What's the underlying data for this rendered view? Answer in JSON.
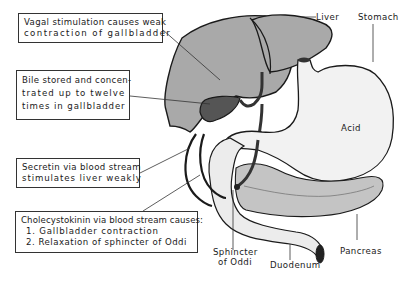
{
  "diagram": {
    "callouts": {
      "vagal": {
        "lines": [
          "Vagal stimulation causes weak",
          "contraction of gallbladder"
        ]
      },
      "bile": {
        "lines": [
          "Bile stored and concen-",
          "trated up to twelve",
          "times in gallbladder"
        ]
      },
      "secretin": {
        "lines": [
          "Secretin via blood stream",
          "stimulates liver weakly"
        ]
      },
      "cck": {
        "lines": [
          "Cholecystokinin via blood stream causes:",
          "1. Gallbladder contraction",
          "2. Relaxation of sphincter of Oddi"
        ]
      }
    },
    "labels": {
      "liver": "Liver",
      "stomach": "Stomach",
      "acid": "Acid",
      "pancreas": "Pancreas",
      "duodenum": "Duodenum",
      "sphincter_line1": "Sphincter",
      "sphincter_line2": "of Oddi"
    },
    "colors": {
      "liver": "#a9a9a9",
      "gallbladder": "#555555",
      "stomach": "#f2f2f2",
      "pancreas": "#c4c4c4",
      "duodenum": "#ececec",
      "outline": "#1a1a1a"
    }
  }
}
